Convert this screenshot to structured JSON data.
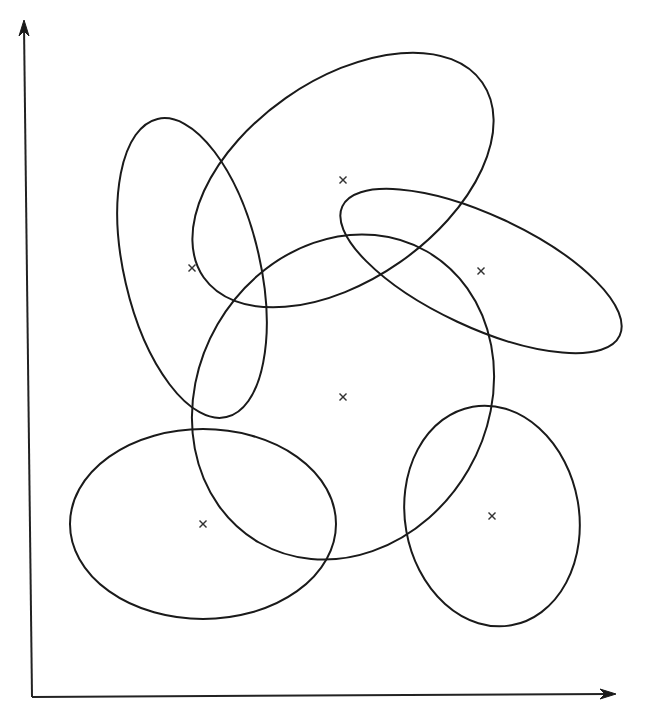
{
  "diagram": {
    "type": "cluster-ellipses",
    "colors": {
      "stroke": "#1a1a1a",
      "background": "#ffffff"
    },
    "axes": {
      "origin": [
        32,
        697
      ],
      "x_axis_end": [
        616,
        694
      ],
      "y_axis_end": [
        24,
        20
      ],
      "x_label": "",
      "y_label": ""
    },
    "center_marker_icon": "cross-x-icon",
    "clusters": [
      {
        "id": "cluster-1",
        "center": [
          192,
          268
        ],
        "rx": 68,
        "ry": 153,
        "rotation": -13
      },
      {
        "id": "cluster-2",
        "center": [
          343,
          180
        ],
        "rx": 170,
        "ry": 100,
        "rotation": -35
      },
      {
        "id": "cluster-3",
        "center": [
          481,
          271
        ],
        "rx": 153,
        "ry": 56,
        "rotation": 25
      },
      {
        "id": "cluster-4",
        "center": [
          343,
          397
        ],
        "rx": 168,
        "ry": 145,
        "rotation": -60
      },
      {
        "id": "cluster-5",
        "center": [
          203,
          524
        ],
        "rx": 133,
        "ry": 95,
        "rotation": 0
      },
      {
        "id": "cluster-6",
        "center": [
          492,
          516
        ],
        "rx": 87,
        "ry": 111,
        "rotation": -10
      }
    ]
  }
}
